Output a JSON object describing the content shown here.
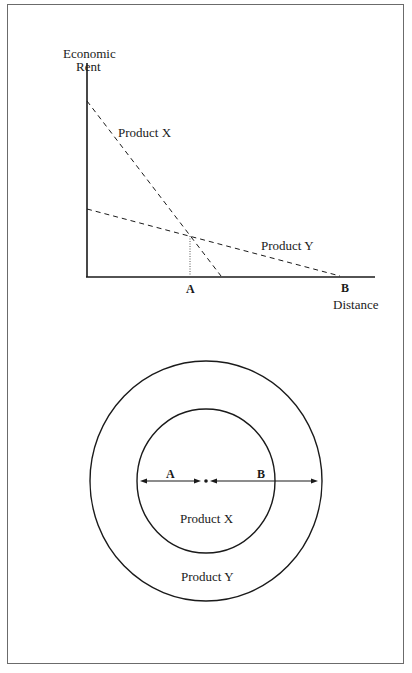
{
  "graph": {
    "y_axis_label_line1": "Economic",
    "y_axis_label_line2": "Rent",
    "x_axis_label": "Distance",
    "tick_a": "A",
    "tick_b": "B",
    "line_x_label": "Product X",
    "line_y_label": "Product Y"
  },
  "rings": {
    "label_a": "A",
    "label_b": "B",
    "inner_label": "Product X",
    "outer_label": "Product Y"
  },
  "colors": {
    "ink": "#1a1a1a",
    "frame": "#6b6b6b",
    "background": "#ffffff"
  }
}
